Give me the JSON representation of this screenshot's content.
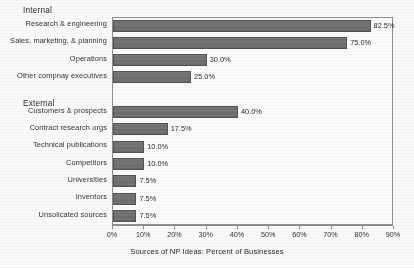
{
  "chart_data": {
    "type": "bar",
    "orientation": "horizontal",
    "title": "",
    "xlabel": "Sources of NP Ideas: Percent of Businesses",
    "ylabel": "",
    "xlim": [
      0,
      90
    ],
    "xtick_labels": [
      "0%",
      "10%",
      "20%",
      "30%",
      "40%",
      "50%",
      "60%",
      "70%",
      "80%",
      "90%"
    ],
    "xtick_values": [
      0,
      10,
      20,
      30,
      40,
      50,
      60,
      70,
      80,
      90
    ],
    "grid": false,
    "legend": false,
    "value_label_suffix": "%",
    "groups": [
      {
        "name": "Internal"
      },
      {
        "name": "External"
      }
    ],
    "categories": [
      "Research & engineering",
      "Sales, marketing, & planning",
      "Operations",
      "Other compnay executives",
      "Customers & prospects",
      "Contract research orgs",
      "Technical publications",
      "Competitors",
      "Universities",
      "Inventors",
      "Unsolicated sources"
    ],
    "values": [
      82.5,
      75.0,
      30.0,
      25.0,
      40.0,
      17.5,
      10.0,
      10.0,
      7.5,
      7.5,
      7.5
    ],
    "value_labels": [
      "82.5%",
      "75.0%",
      "30.0%",
      "25.0%",
      "40.0%",
      "17.5%",
      "10.0%",
      "10.0%",
      "7.5%",
      "7.5%",
      "7.5%"
    ],
    "rows": [
      {
        "label": "Research & engineering",
        "value": 82.5,
        "value_label": "82.5%",
        "group": "Internal",
        "spacer": false
      },
      {
        "label": "Sales, marketing, & planning",
        "value": 75.0,
        "value_label": "75.0%",
        "group": "Internal",
        "spacer": false
      },
      {
        "label": "Operations",
        "value": 30.0,
        "value_label": "30.0%",
        "group": "Internal",
        "spacer": false
      },
      {
        "label": "Other compnay executives",
        "value": 25.0,
        "value_label": "25.0%",
        "group": "Internal",
        "spacer": false
      },
      {
        "label": "",
        "value": 0,
        "value_label": "",
        "group": "",
        "spacer": true
      },
      {
        "label": "Customers & prospects",
        "value": 40.0,
        "value_label": "40.0%",
        "group": "External",
        "spacer": false
      },
      {
        "label": "Contract research orgs",
        "value": 17.5,
        "value_label": "17.5%",
        "group": "External",
        "spacer": false
      },
      {
        "label": "Technical publications",
        "value": 10.0,
        "value_label": "10.0%",
        "group": "External",
        "spacer": false
      },
      {
        "label": "Competitors",
        "value": 10.0,
        "value_label": "10.0%",
        "group": "External",
        "spacer": false
      },
      {
        "label": "Universities",
        "value": 7.5,
        "value_label": "7.5%",
        "group": "External",
        "spacer": false
      },
      {
        "label": "Inventors",
        "value": 7.5,
        "value_label": "7.5%",
        "group": "External",
        "spacer": false
      },
      {
        "label": "Unsolicated sources",
        "value": 7.5,
        "value_label": "7.5%",
        "group": "External",
        "spacer": false
      }
    ],
    "colors": {
      "bar_fill": "#6f6f6f",
      "bar_edge": "#4e4e4e",
      "plot_border": "#8d8d8d",
      "text": "#232323",
      "background": "#fdfdfd"
    }
  }
}
